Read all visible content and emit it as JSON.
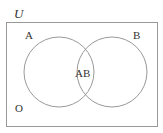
{
  "diagram": {
    "type": "venn",
    "universe_label": "U",
    "sets": [
      {
        "name": "A",
        "label": "A"
      },
      {
        "name": "B",
        "label": "B"
      }
    ],
    "intersection_label": "AB",
    "outside_label": "O",
    "colors": {
      "stroke": "#999999",
      "text": "#333333",
      "background": "#ffffff"
    }
  }
}
